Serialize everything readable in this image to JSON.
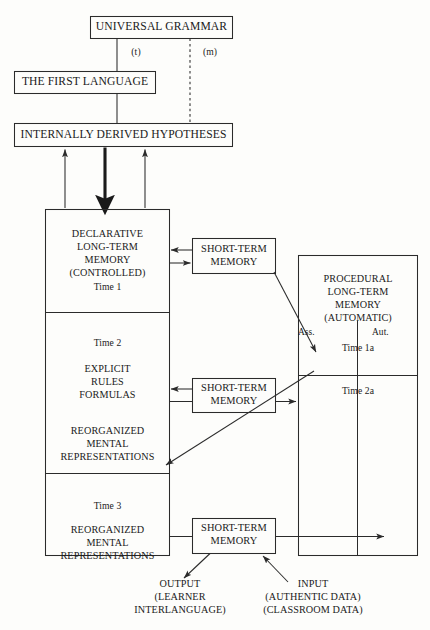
{
  "figure": {
    "type": "flow-diagram",
    "domain": "second-language-acquisition-model",
    "background_color": "#fdfdfb",
    "line_color": "#2b2b2b"
  },
  "nodes": {
    "universal_grammar": "UNIVERSAL GRAMMAR",
    "first_language": "THE FIRST LANGUAGE",
    "internal_hypotheses": "INTERNALLY DERIVED HYPOTHESES",
    "declarative": "DECLARATIVE\nLONG-TERM\nMEMORY\n(CONTROLLED)",
    "declarative_time": "Time 1",
    "explicit_time": "Time 2",
    "explicit_rules": "EXPLICIT\nRULES\nFORMULAS",
    "reorganized_2": "REORGANIZED\nMENTAL\nREPRESENTATIONS",
    "time_3": "Time 3",
    "reorganized_3": "REORGANIZED\nMENTAL\nREPRESENTATIONS",
    "procedural": "PROCEDURAL\nLONG-TERM\nMEMORY\n(AUTOMATIC)",
    "procedural_ass": "Ass.",
    "procedural_aut": "Aut.",
    "time_1a": "Time 1a",
    "time_2a": "Time 2a",
    "stm_1": "SHORT-TERM\nMEMORY",
    "stm_2": "SHORT-TERM\nMEMORY",
    "stm_3": "SHORT-TERM\nMEMORY",
    "output": "OUTPUT\n(LEARNER\nINTERLANGUAGE)",
    "input": "INPUT\n(AUTHENTIC DATA)\n(CLASSROOM DATA)"
  },
  "edge_labels": {
    "transfer": "(t)",
    "markedness": "(m)"
  }
}
